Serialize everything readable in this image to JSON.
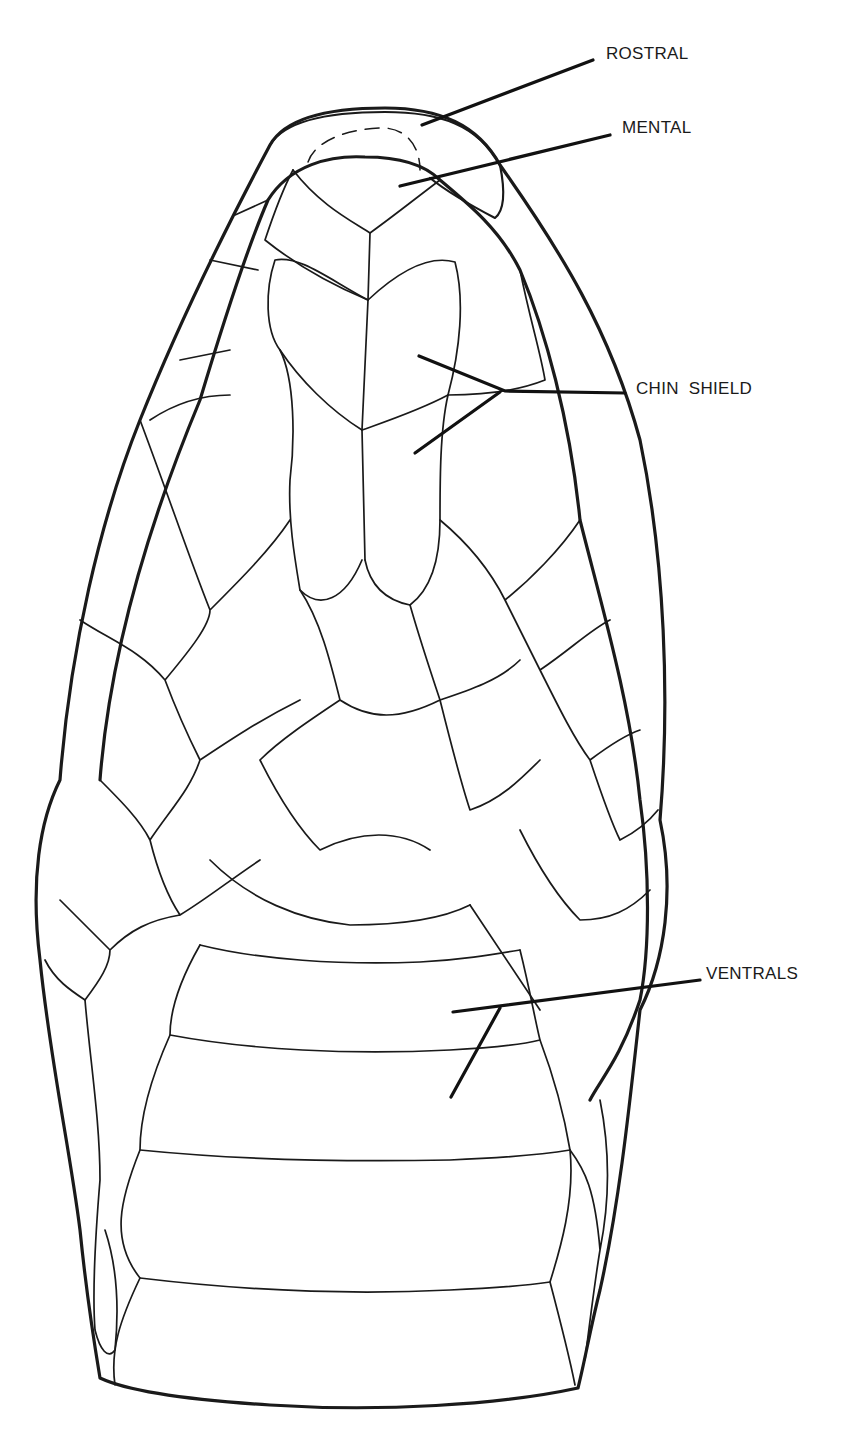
{
  "figure": {
    "line_color": "#1a1a1a",
    "background": "#ffffff"
  },
  "labels": {
    "rostral": {
      "text": "ROSTRAL",
      "x": 606,
      "y": 46
    },
    "mental": {
      "text": "MENTAL",
      "x": 622,
      "y": 120
    },
    "chin_shield": {
      "text": "CHIN  SHIELD",
      "x": 636,
      "y": 380
    },
    "ventrals": {
      "text": "VENTRALS",
      "x": 706,
      "y": 966
    }
  },
  "leaders": {
    "rostral": [
      [
        422,
        125
      ],
      [
        593,
        60
      ]
    ],
    "mental": [
      [
        400,
        186
      ],
      [
        610,
        135
      ]
    ],
    "chin_shield_upper": [
      [
        419,
        356
      ],
      [
        505,
        391
      ],
      [
        625,
        393
      ]
    ],
    "chin_shield_lower": [
      [
        415,
        453
      ],
      [
        500,
        392
      ]
    ],
    "ventrals_upper": [
      [
        453,
        1012
      ],
      [
        700,
        980
      ]
    ],
    "ventrals_lower": [
      [
        451,
        1097
      ],
      [
        500,
        1008
      ]
    ]
  }
}
